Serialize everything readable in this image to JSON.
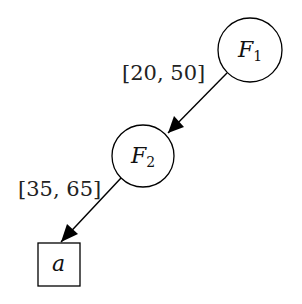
{
  "diagram": {
    "type": "decision-tree",
    "nodes": [
      {
        "id": "F1",
        "shape": "circle",
        "label_main": "F",
        "label_sub": "1",
        "cx": 250,
        "cy": 50,
        "r": 32
      },
      {
        "id": "F2",
        "shape": "circle",
        "label_main": "F",
        "label_sub": "2",
        "cx": 143,
        "cy": 156,
        "r": 31
      },
      {
        "id": "a",
        "shape": "box",
        "label": "a",
        "x": 38,
        "y": 243,
        "w": 42,
        "h": 43
      }
    ],
    "edges": [
      {
        "from": "F1",
        "to": "F2",
        "label": "[20, 50]"
      },
      {
        "from": "F2",
        "to": "a",
        "label": "[35, 65]"
      }
    ]
  }
}
